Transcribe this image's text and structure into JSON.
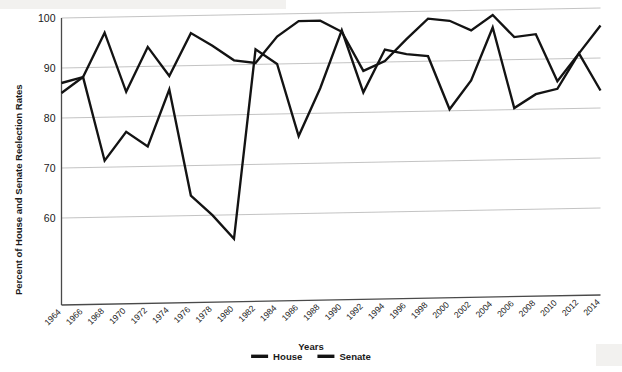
{
  "chart_data": {
    "type": "line",
    "title": "",
    "xlabel": "Years",
    "ylabel": "Percent of House and Senate Reelection Rates",
    "x": [
      1964,
      1966,
      1968,
      1970,
      1972,
      1974,
      1976,
      1978,
      1980,
      1982,
      1984,
      1986,
      1988,
      1990,
      1992,
      1994,
      1996,
      1998,
      2000,
      2002,
      2004,
      2006,
      2008,
      2010,
      2012,
      2014
    ],
    "xtick_labels": [
      "1964",
      "1966",
      "1968",
      "1970",
      "1972",
      "1974",
      "1976",
      "1978",
      "1980",
      "1982",
      "1984",
      "1986",
      "1988",
      "1990",
      "1992",
      "1994",
      "1996",
      "1998",
      "2000",
      "2002",
      "2004",
      "2006",
      "2008",
      "2010",
      "2012",
      "2014"
    ],
    "ytick_labels": [
      "60",
      "70",
      "80",
      "90",
      "100"
    ],
    "yticks": [
      60,
      70,
      80,
      90,
      100
    ],
    "ylim": [
      54,
      100
    ],
    "xlim": [
      1964,
      2014
    ],
    "grid": "horizontal",
    "legend_position": "bottom-center",
    "series": [
      {
        "name": "House",
        "color": "#131313",
        "values": [
          87.0,
          88.1,
          96.9,
          85.0,
          93.9,
          88.0,
          96.5,
          93.9,
          90.9,
          90.3,
          95.5,
          98.5,
          98.5,
          96.2,
          88.3,
          90.2,
          94.5,
          98.5,
          98.0,
          96.0,
          99.0,
          94.5,
          95.0,
          85.5,
          91.0,
          96.5
        ]
      },
      {
        "name": "Senate",
        "color": "#131313",
        "values": [
          85.0,
          88.1,
          71.3,
          77.0,
          74.0,
          85.3,
          64.0,
          60.0,
          55.2,
          93.0,
          90.0,
          75.5,
          85.0,
          96.5,
          84.0,
          92.5,
          91.5,
          91.0,
          80.3,
          86.0,
          96.5,
          80.3,
          83.0,
          84.0,
          91.0,
          83.5
        ]
      }
    ]
  },
  "legend": {
    "entries": [
      {
        "label": "House"
      },
      {
        "label": "Senate"
      }
    ]
  },
  "axes": {
    "x_title": "Years",
    "y_title": "Percent of House and Senate Reelection Rates"
  }
}
